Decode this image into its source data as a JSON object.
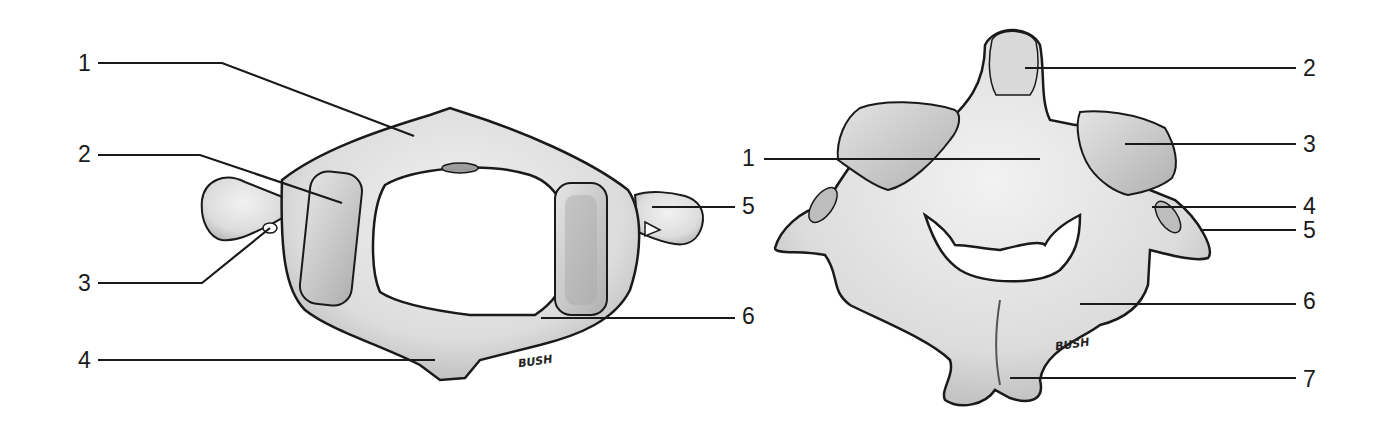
{
  "diagram": {
    "colors": {
      "bone": "#e6e6e6",
      "bone_shade": "#bdbdbd",
      "outline": "#1a1a1a",
      "leader": "#1a1a1a",
      "background": "#ffffff"
    },
    "left_figure": {
      "name": "atlas",
      "labels": [
        {
          "num": "1",
          "x": 78,
          "y": 52
        },
        {
          "num": "2",
          "x": 78,
          "y": 143
        },
        {
          "num": "3",
          "x": 78,
          "y": 272
        },
        {
          "num": "4",
          "x": 78,
          "y": 349
        },
        {
          "num": "5",
          "x": 742,
          "y": 195
        },
        {
          "num": "6",
          "x": 742,
          "y": 305
        }
      ],
      "signature": "BUSH"
    },
    "right_figure": {
      "name": "axis",
      "labels": [
        {
          "num": "2",
          "x": 1303,
          "y": 57
        },
        {
          "num": "3",
          "x": 1303,
          "y": 133
        },
        {
          "num": "1",
          "x": 742,
          "y": 147
        },
        {
          "num": "4",
          "x": 1303,
          "y": 195
        },
        {
          "num": "5",
          "x": 1303,
          "y": 219
        },
        {
          "num": "6",
          "x": 1303,
          "y": 290
        },
        {
          "num": "7",
          "x": 1303,
          "y": 368
        }
      ],
      "signature": "BUSH"
    }
  }
}
